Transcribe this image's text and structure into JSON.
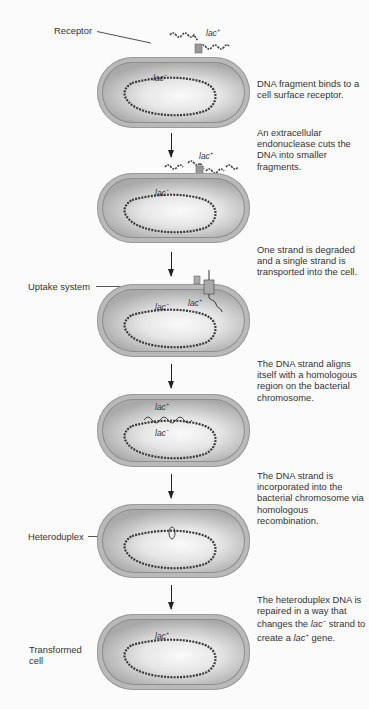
{
  "labels": {
    "receptor": "Receptor",
    "uptake_system": "Uptake system",
    "heteroduplex": "Heteroduplex",
    "transformed_cell_line1": "Transformed",
    "transformed_cell_line2": "cell"
  },
  "genes": {
    "lac_plus_base": "lac",
    "lac_plus_sup": "+",
    "lac_minus_base": "lac",
    "lac_minus_sup": "−"
  },
  "steps": [
    {
      "description": "DNA fragment binds to a cell surface receptor."
    },
    {
      "description": "An extracellular endonuclease cuts the DNA into smaller fragments."
    },
    {
      "description": "One strand is degraded and a single strand is transported into the cell."
    },
    {
      "description": "The DNA strand aligns itself with a homologous region on the bacterial chromosome."
    },
    {
      "description": "The DNA strand is incorporated into the bacterial chromosome via homologous recombination."
    },
    {
      "description_pre": "The heteroduplex DNA is repaired in a way that changes the ",
      "description_gene1": "lac",
      "description_gene1_sup": "−",
      "description_mid": " strand to create a ",
      "description_gene2": "lac",
      "description_gene2_sup": "+",
      "description_post": " gene."
    }
  ],
  "colors": {
    "cell_wall": "#b9b9b9",
    "cytoplasm_center": "#fafafa",
    "dna": "#3a3a3a",
    "text": "#333333"
  }
}
